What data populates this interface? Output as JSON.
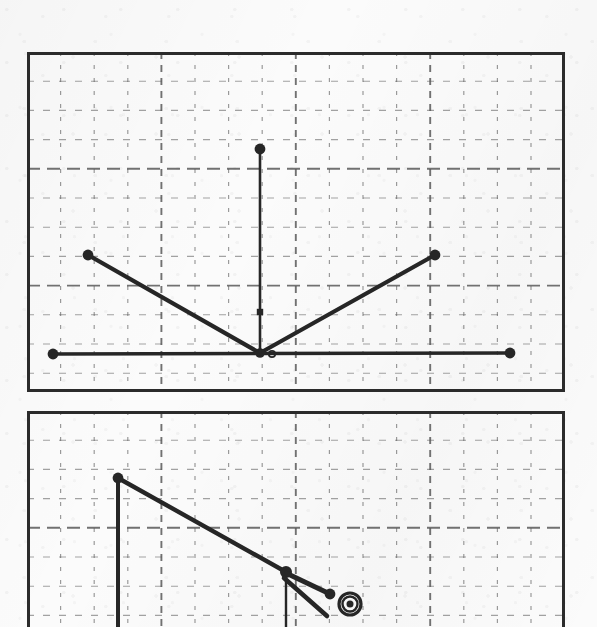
{
  "document": {
    "kind": "scanned-graph-paper-sheet",
    "background_color": "#fbfbfb",
    "ink_color": "#262626",
    "grid_color": "#5a5a5a",
    "panel_border_color": "#2b2b2b"
  },
  "panels": [
    {
      "id": "upper-plot-panel",
      "name": "upper-plot",
      "frame": {
        "x": 27,
        "y": 52,
        "width": 538,
        "height": 340
      },
      "grid": {
        "minor_spacing_x": 33.6,
        "minor_spacing_y": 29.2,
        "major_every": 4,
        "style": "dashed",
        "visible": true
      },
      "clipped_at_bottom": false
    },
    {
      "id": "lower-plot-panel",
      "name": "lower-plot",
      "frame": {
        "x": 27,
        "y": 411,
        "width": 538,
        "height": 216
      },
      "grid": {
        "minor_spacing_x": 33.6,
        "minor_spacing_y": 29.2,
        "major_every": 4,
        "style": "dashed",
        "visible": true
      },
      "clipped_at_bottom": true
    }
  ],
  "chart_data": [
    {
      "type": "line",
      "id": "upper-plot",
      "title": "",
      "xlabel": "",
      "ylabel": "",
      "grid": true,
      "legend": "none",
      "xlim": [
        27,
        565
      ],
      "ylim": [
        392,
        52
      ],
      "series": [
        {
          "name": "v-shape-curve",
          "stroke": "#262626",
          "width": 4.2,
          "markers": "filled-circle",
          "points": [
            {
              "x": 88,
              "y": 255,
              "marker": "dot"
            },
            {
              "x": 260,
              "y": 353,
              "marker": "vertex"
            },
            {
              "x": 435,
              "y": 255,
              "marker": "dot"
            }
          ]
        },
        {
          "name": "horizontal-baseline",
          "stroke": "#262626",
          "width": 3.6,
          "markers": "filled-circle",
          "points": [
            {
              "x": 53,
              "y": 354,
              "marker": "dot"
            },
            {
              "x": 510,
              "y": 353,
              "marker": "dot"
            }
          ]
        },
        {
          "name": "vertical-spike",
          "stroke": "#262626",
          "width": 2.6,
          "markers": "filled-circle",
          "points": [
            {
              "x": 260,
              "y": 149,
              "marker": "dot"
            },
            {
              "x": 260,
              "y": 312,
              "marker": "square"
            },
            {
              "x": 260,
              "y": 353,
              "marker": "none"
            }
          ]
        }
      ],
      "annotations": [
        {
          "kind": "small-open-dot",
          "x": 272,
          "y": 354
        }
      ]
    },
    {
      "type": "line",
      "id": "lower-plot",
      "title": "",
      "xlabel": "",
      "ylabel": "",
      "grid": true,
      "legend": "none",
      "xlim": [
        27,
        565
      ],
      "ylim": [
        627,
        411
      ],
      "series": [
        {
          "name": "descending-diagonal",
          "stroke": "#262626",
          "width": 4.4,
          "markers": "filled-circle",
          "points": [
            {
              "x": 118,
              "y": 478,
              "marker": "dot"
            },
            {
              "x": 286,
              "y": 572,
              "marker": "node"
            }
          ]
        },
        {
          "name": "left-vertical-drop",
          "stroke": "#262626",
          "width": 4.0,
          "markers": "none",
          "points": [
            {
              "x": 118,
              "y": 478,
              "marker": "none"
            },
            {
              "x": 118,
              "y": 627,
              "marker": "none"
            }
          ]
        },
        {
          "name": "center-vertical-drop",
          "stroke": "#262626",
          "width": 2.4,
          "markers": "none",
          "points": [
            {
              "x": 286,
              "y": 572,
              "marker": "none"
            },
            {
              "x": 286,
              "y": 627,
              "marker": "none"
            }
          ]
        },
        {
          "name": "upper-prong",
          "stroke": "#262626",
          "width": 5.0,
          "markers": "filled-circle",
          "points": [
            {
              "x": 288,
              "y": 574,
              "marker": "none"
            },
            {
              "x": 330,
              "y": 594,
              "marker": "dot"
            }
          ]
        },
        {
          "name": "lower-prong",
          "stroke": "#262626",
          "width": 4.6,
          "markers": "none",
          "points": [
            {
              "x": 284,
              "y": 578,
              "marker": "none"
            },
            {
              "x": 327,
              "y": 616,
              "marker": "none"
            }
          ]
        }
      ],
      "annotations": [
        {
          "kind": "concentric-ring-target",
          "x": 350,
          "y": 604,
          "outer_radius": 11,
          "middle_radius": 7.5,
          "inner_radius": 3.5
        }
      ]
    }
  ]
}
